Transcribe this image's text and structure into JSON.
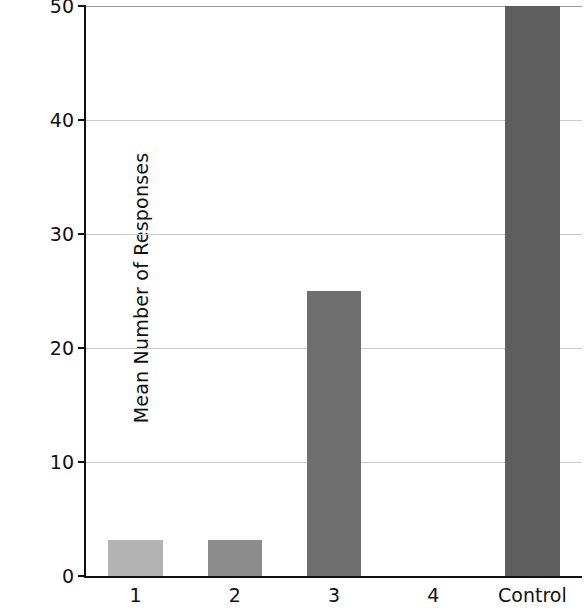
{
  "chart_data": {
    "type": "bar",
    "title": "",
    "xlabel": "",
    "ylabel": "Mean Number of Responses",
    "categories": [
      "1",
      "2",
      "3",
      "4",
      "Control"
    ],
    "values": [
      3.2,
      3.2,
      25,
      0,
      50
    ],
    "bar_colors": [
      "#b3b3b3",
      "#8c8c8c",
      "#6e6e6e",
      "#6e6e6e",
      "#5e5e5e"
    ],
    "ylim": [
      0,
      50
    ],
    "yticks": [
      0,
      10,
      20,
      30,
      40,
      50
    ],
    "ytick_labels": [
      "0",
      "10",
      "20",
      "30",
      "40",
      "50"
    ],
    "grid": true,
    "grid_axis": "y",
    "legend": null,
    "annotations": []
  }
}
